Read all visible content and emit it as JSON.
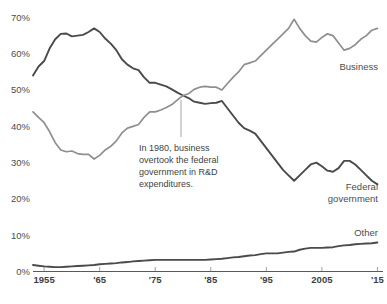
{
  "chart_data": {
    "type": "line",
    "title": "",
    "xlabel": "",
    "ylabel": "",
    "xlim": [
      1953,
      2016
    ],
    "ylim": [
      0,
      72
    ],
    "grid": false,
    "legend_position": "inline-right",
    "y_ticks": [
      "0%",
      "10%",
      "20%",
      "30%",
      "40%",
      "50%",
      "60%",
      "70%"
    ],
    "y_tick_values": [
      0,
      10,
      20,
      30,
      40,
      50,
      60,
      70
    ],
    "x_ticks": [
      "1955",
      "'65",
      "'75",
      "'85",
      "'95",
      "2005",
      "'15"
    ],
    "x_tick_values": [
      1955,
      1965,
      1975,
      1985,
      1995,
      2005,
      2015
    ],
    "annotations": [
      {
        "name": "crossover-note",
        "lines": [
          "In 1980, business",
          "overtook the federal",
          "government in R&D",
          "expenditures."
        ],
        "x": 1980,
        "y": 48.5
      }
    ],
    "series": [
      {
        "name": "Federal government",
        "label": "Federal government",
        "color": "#4a4a4a",
        "x": [
          1953,
          1954,
          1955,
          1956,
          1957,
          1958,
          1959,
          1960,
          1961,
          1962,
          1963,
          1964,
          1965,
          1966,
          1967,
          1968,
          1969,
          1970,
          1971,
          1972,
          1973,
          1974,
          1975,
          1976,
          1977,
          1978,
          1979,
          1980,
          1981,
          1982,
          1983,
          1984,
          1985,
          1986,
          1987,
          1988,
          1989,
          1990,
          1991,
          1992,
          1993,
          1994,
          1995,
          1996,
          1997,
          1998,
          1999,
          2000,
          2001,
          2002,
          2003,
          2004,
          2005,
          2006,
          2007,
          2008,
          2009,
          2010,
          2011,
          2012,
          2013,
          2014,
          2015
        ],
        "values": [
          54.0,
          56.5,
          58.0,
          61.5,
          64.0,
          65.5,
          65.6,
          64.8,
          65.0,
          65.2,
          66.0,
          67.0,
          66.0,
          64.2,
          62.8,
          61.0,
          58.5,
          57.0,
          56.0,
          55.5,
          53.5,
          52.0,
          52.0,
          51.5,
          51.0,
          50.2,
          49.3,
          48.5,
          47.8,
          46.8,
          46.5,
          46.2,
          46.4,
          46.5,
          47.0,
          45.0,
          43.0,
          41.0,
          39.5,
          38.8,
          38.0,
          36.0,
          34.0,
          32.0,
          30.0,
          28.0,
          26.5,
          25.0,
          26.5,
          28.0,
          29.5,
          30.0,
          29.0,
          27.8,
          27.5,
          28.5,
          30.5,
          30.5,
          29.5,
          28.0,
          26.5,
          25.0,
          24.0
        ]
      },
      {
        "name": "Business",
        "label": "Business",
        "color": "#8f8f8f",
        "x": [
          1953,
          1954,
          1955,
          1956,
          1957,
          1958,
          1959,
          1960,
          1961,
          1962,
          1963,
          1964,
          1965,
          1966,
          1967,
          1968,
          1969,
          1970,
          1971,
          1972,
          1973,
          1974,
          1975,
          1976,
          1977,
          1978,
          1979,
          1980,
          1981,
          1982,
          1983,
          1984,
          1985,
          1986,
          1987,
          1988,
          1989,
          1990,
          1991,
          1992,
          1993,
          1994,
          1995,
          1996,
          1997,
          1998,
          1999,
          2000,
          2001,
          2002,
          2003,
          2004,
          2005,
          2006,
          2007,
          2008,
          2009,
          2010,
          2011,
          2012,
          2013,
          2014,
          2015
        ],
        "values": [
          44.0,
          42.5,
          41.0,
          38.5,
          35.5,
          33.5,
          33.0,
          33.2,
          32.5,
          32.3,
          32.3,
          31.0,
          32.0,
          33.5,
          34.5,
          36.0,
          38.2,
          39.5,
          40.0,
          40.5,
          42.5,
          44.0,
          44.0,
          44.5,
          45.2,
          46.0,
          47.3,
          48.5,
          49.0,
          50.2,
          50.8,
          51.0,
          50.8,
          50.8,
          50.0,
          51.8,
          53.5,
          55.0,
          57.0,
          57.5,
          58.0,
          59.5,
          61.0,
          62.5,
          64.0,
          65.5,
          67.0,
          69.5,
          67.0,
          65.0,
          63.5,
          63.2,
          64.5,
          65.5,
          65.0,
          63.0,
          61.0,
          61.5,
          62.5,
          64.0,
          65.0,
          66.5,
          67.0
        ]
      },
      {
        "name": "Other",
        "label": "Other",
        "color": "#4a4a4a",
        "x": [
          1953,
          1954,
          1955,
          1956,
          1957,
          1958,
          1959,
          1960,
          1961,
          1962,
          1963,
          1964,
          1965,
          1966,
          1967,
          1968,
          1969,
          1970,
          1971,
          1972,
          1973,
          1974,
          1975,
          1976,
          1977,
          1978,
          1979,
          1980,
          1981,
          1982,
          1983,
          1984,
          1985,
          1986,
          1987,
          1988,
          1989,
          1990,
          1991,
          1992,
          1993,
          1994,
          1995,
          1996,
          1997,
          1998,
          1999,
          2000,
          2001,
          2002,
          2003,
          2004,
          2005,
          2006,
          2007,
          2008,
          2009,
          2010,
          2011,
          2012,
          2013,
          2014,
          2015
        ],
        "values": [
          1.8,
          1.6,
          1.4,
          1.3,
          1.2,
          1.2,
          1.3,
          1.4,
          1.5,
          1.6,
          1.7,
          1.8,
          2.0,
          2.1,
          2.2,
          2.3,
          2.5,
          2.6,
          2.8,
          2.9,
          3.0,
          3.1,
          3.2,
          3.2,
          3.2,
          3.2,
          3.2,
          3.2,
          3.2,
          3.2,
          3.2,
          3.2,
          3.3,
          3.4,
          3.5,
          3.7,
          3.9,
          4.0,
          4.2,
          4.4,
          4.5,
          4.8,
          5.0,
          5.0,
          5.0,
          5.2,
          5.4,
          5.5,
          6.0,
          6.3,
          6.5,
          6.5,
          6.5,
          6.6,
          6.7,
          7.0,
          7.2,
          7.3,
          7.5,
          7.6,
          7.7,
          7.8,
          8.0
        ]
      }
    ]
  }
}
